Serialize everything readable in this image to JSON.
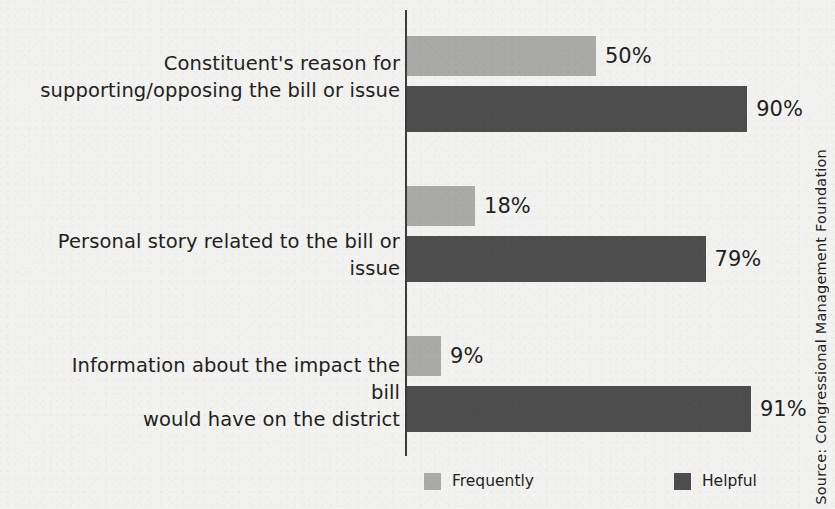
{
  "chart_data": {
    "type": "bar",
    "orientation": "horizontal",
    "grouped": true,
    "title": "",
    "subtitle": "",
    "xlabel": "",
    "ylabel": "",
    "xlim": [
      0,
      100
    ],
    "grid": false,
    "legend_position": "bottom",
    "value_suffix": "%",
    "categories": [
      "Constituent's reason for\nsupporting/opposing the bill or issue",
      "Personal story related to the bill or issue",
      "Information about the impact the bill\nwould have on the district"
    ],
    "series": [
      {
        "name": "Frequently",
        "color": "#aaaaa8",
        "values": [
          50,
          18,
          9
        ],
        "labels": [
          "50%",
          "18%",
          "9%"
        ]
      },
      {
        "name": "Helpful",
        "color": "#4d4d4d",
        "values": [
          90,
          79,
          91
        ],
        "labels": [
          "90%",
          "79%",
          "91%"
        ]
      }
    ],
    "source": "Source: Congressional Management Foundation"
  },
  "groups": [
    {
      "label": "Constituent's reason for\nsupporting/opposing the bill or issue",
      "light_value": 50,
      "light_label": "50%",
      "dark_value": 90,
      "dark_label": "90%"
    },
    {
      "label": "Personal story related to the bill or issue",
      "light_value": 18,
      "light_label": "18%",
      "dark_value": 79,
      "dark_label": "79%"
    },
    {
      "label": "Information about the impact the bill\nwould have on the district",
      "light_value": 9,
      "light_label": "9%",
      "dark_value": 91,
      "dark_label": "91%"
    }
  ],
  "legend": {
    "items": [
      {
        "label": "Frequently",
        "color": "#aaaaa8"
      },
      {
        "label": "Helpful",
        "color": "#4d4d4d"
      }
    ]
  },
  "source": {
    "text": "Source: Congressional Management Foundation"
  },
  "colors": {
    "background": "#f2f2f0",
    "text": "#231f20",
    "axis": "#3c3c3c",
    "series_light": "#aaaaa8",
    "series_dark": "#4d4d4d"
  }
}
